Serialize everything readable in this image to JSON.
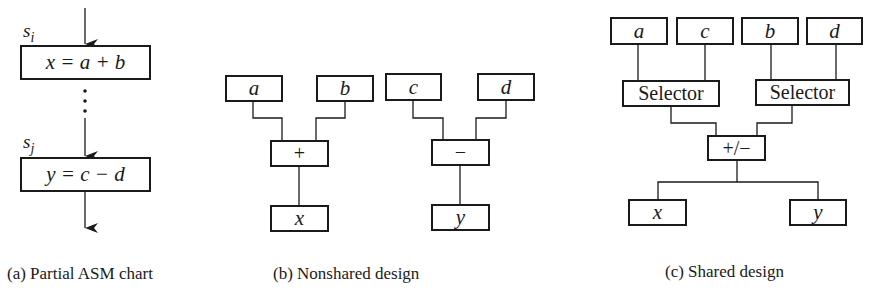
{
  "panel_a": {
    "state_i": {
      "name": "s",
      "sub": "i"
    },
    "state_j": {
      "name": "s",
      "sub": "j"
    },
    "box1": "x = a + b",
    "box2": "y = c − d",
    "caption": "(a)  Partial ASM chart"
  },
  "panel_b": {
    "inputs": [
      "a",
      "b",
      "c",
      "d"
    ],
    "ops": [
      "+",
      "−"
    ],
    "outputs": [
      "x",
      "y"
    ],
    "caption": "(b)  Nonshared design"
  },
  "panel_c": {
    "inputs": [
      "a",
      "c",
      "b",
      "d"
    ],
    "selectors": [
      "Selector",
      "Selector"
    ],
    "op": "+/−",
    "outputs": [
      "x",
      "y"
    ],
    "caption": "(c)  Shared design"
  },
  "colors": {
    "line": "#1a1a1a",
    "background": "#ffffff"
  }
}
